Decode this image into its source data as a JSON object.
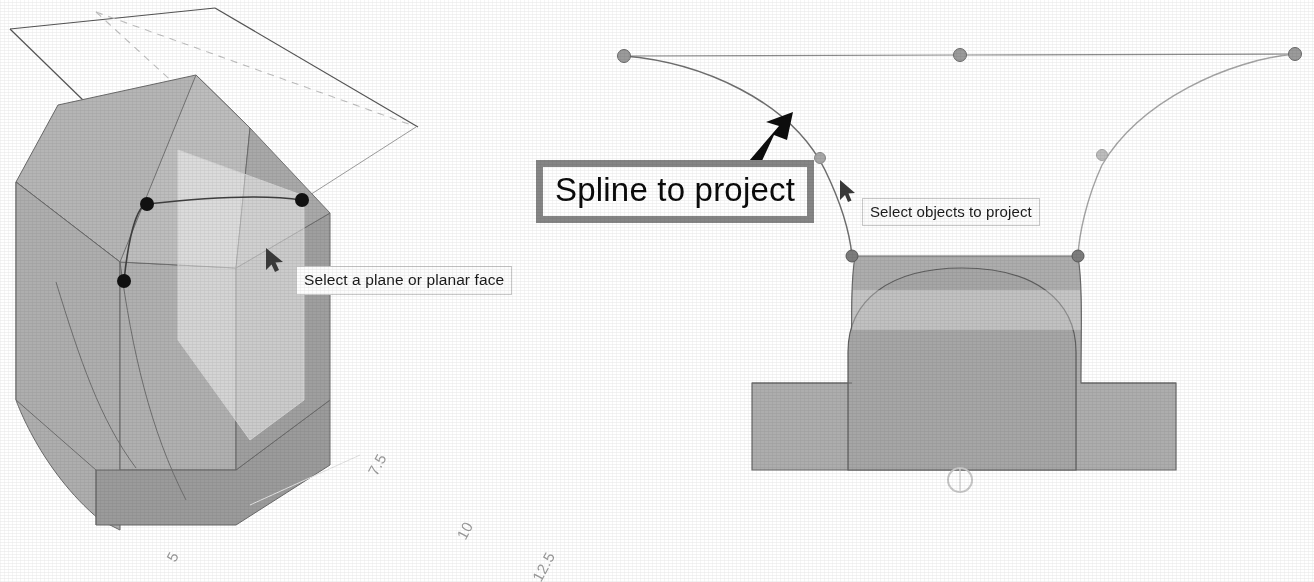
{
  "scene": {
    "background_color": "#ffffff",
    "solid_fill": "#a9a9a9",
    "solid_fill_light": "#bcbcbc",
    "solid_fill_dark": "#9a9a9a",
    "edge_color": "#5a5a5a",
    "spline_color": "#4a4a4a",
    "control_point_color": "#111111",
    "control_point_color_gray": "#9b9b9b",
    "plane_edge_color": "#555555",
    "plane_hidden_edge_color": "#c0c0c0",
    "callout_border_color": "#868686",
    "ruler_label_color": "#9a9a9a"
  },
  "left_view": {
    "name": "isometric-projection-setup",
    "hint": "Select a plane or planar face",
    "cursor": "arrow-cursor",
    "plane": {
      "name": "target-plane",
      "style": "outlined parallelogram with dashed hidden edges",
      "visible_edges": 2,
      "hidden_edges": 2
    },
    "spline": {
      "name": "source-spline",
      "control_point_count": 3,
      "control_points": [
        {
          "x": 124,
          "y": 281
        },
        {
          "x": 147,
          "y": 204
        },
        {
          "x": 302,
          "y": 200
        }
      ]
    },
    "solid": {
      "name": "bracket-solid-isometric",
      "faces": [
        "top",
        "front-curved",
        "side",
        "base"
      ]
    }
  },
  "right_view": {
    "name": "front-projection-result",
    "hint": "Select objects to project",
    "callout": "Spline to project",
    "cursor": "arrow-cursor",
    "annotation_arrow": "thick-black-arrow",
    "spline": {
      "name": "projected-spline",
      "control_point_count": 6,
      "control_points": [
        {
          "x": 624,
          "y": 56
        },
        {
          "x": 960,
          "y": 55
        },
        {
          "x": 1295,
          "y": 54
        },
        {
          "x": 820,
          "y": 158
        },
        {
          "x": 1102,
          "y": 155
        },
        {
          "x": 852,
          "y": 256
        },
        {
          "x": 1078,
          "y": 255
        }
      ],
      "control_polygon_visible": true
    },
    "solid": {
      "name": "bracket-solid-front-view",
      "features": [
        "central-arch",
        "left-fillet-flank",
        "right-fillet-flank",
        "base-plate"
      ]
    },
    "origin_marker": "origin-circle-marker"
  },
  "rulers": {
    "name": "measurement-ruler-labels",
    "labels": [
      "5",
      "7.5",
      "10",
      "12.5"
    ]
  }
}
